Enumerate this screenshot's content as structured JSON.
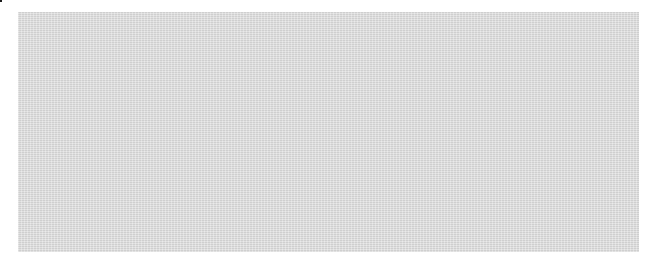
{
  "figure": {
    "kind": "kinship-diagram",
    "title": "",
    "panel": {
      "background_color": "#d6d6d6",
      "x": 18,
      "y": 12,
      "width": 621,
      "height": 240
    },
    "colors": {
      "line": "#262626",
      "fill_dark": "#595959",
      "fill_light": "#fbfbfb",
      "stroke": "#1a1a1a",
      "text": "#1f1f1f",
      "page_background": "#ffffff"
    },
    "legend_note": "",
    "symbols": {
      "circle_solid": "female solid dark",
      "circle_striped": "female white with diagonal dark band",
      "triangle_vsplit": "male dark-left white-right",
      "triangle_hsplit": "male white-top dark-bottom",
      "square_label": "ego reference square",
      "equals": "marriage link"
    }
  },
  "marriage": {
    "symbol": "=",
    "x": 307,
    "y": 86,
    "descent_line": {
      "x": 303,
      "y_from": 100,
      "y_to": 211
    }
  },
  "ego": {
    "label": "Ego",
    "x": 284,
    "y": 211,
    "width": 42,
    "height": 28
  },
  "generation_top": {
    "sibling_bars": [
      {
        "name": "left-sibling-bar",
        "x1": 106,
        "y": 33,
        "x2": 300,
        "drop_top_y": 33
      },
      {
        "name": "right-sibling-bar",
        "x1": 369,
        "y": 33,
        "x2": 563,
        "drop_top_y": 33
      }
    ],
    "nodes": [
      {
        "id": "t1",
        "type": "circle_solid",
        "cx": 106,
        "cy": 86,
        "r": 17,
        "has_descent": true
      },
      {
        "id": "t2",
        "type": "triangle_vsplit",
        "cx": 203,
        "cy": 86,
        "size": 42,
        "has_descent": true
      },
      {
        "id": "t3",
        "type": "triangle_vsplit",
        "cx": 282,
        "cy": 86,
        "size": 42,
        "has_descent": false
      },
      {
        "id": "t4",
        "type": "circle_solid",
        "cx": 369,
        "cy": 86,
        "r": 17,
        "has_descent": false
      },
      {
        "id": "t5",
        "type": "circle_solid",
        "cx": 466,
        "cy": 86,
        "r": 17,
        "has_descent": true
      },
      {
        "id": "t6",
        "type": "triangle_vsplit",
        "cx": 563,
        "cy": 86,
        "size": 42,
        "has_descent": true
      }
    ]
  },
  "generation_bottom": {
    "family_groups": [
      {
        "name": "family-1",
        "parent_drop_x": 106,
        "bar_y": 162,
        "bar_x1": 67,
        "bar_x2": 145,
        "children": [
          {
            "id": "b1",
            "type": "triangle_hsplit",
            "cx": 67,
            "cy": 218,
            "size": 44
          },
          {
            "id": "b2",
            "type": "circle_striped",
            "cx": 145,
            "cy": 218,
            "r": 18
          }
        ]
      },
      {
        "name": "family-2",
        "parent_drop_x": 203,
        "bar_y": 162,
        "bar_x1": 166,
        "bar_x2": 242,
        "children": [
          {
            "id": "b3",
            "type": "triangle_hsplit",
            "cx": 166,
            "cy": 218,
            "size": 44
          },
          {
            "id": "b4",
            "type": "circle_striped",
            "cx": 242,
            "cy": 218,
            "r": 18
          }
        ]
      },
      {
        "name": "family-3-ego",
        "parent_drop_x": 303,
        "bar_y": 162,
        "bar_x1": 263,
        "bar_x2": 350,
        "children": [
          {
            "id": "b5",
            "type": "triangle_hsplit",
            "cx": 263,
            "cy": 218,
            "size": 44
          },
          {
            "id": "b6",
            "type": "square_label",
            "cx": 305,
            "cy": 225
          },
          {
            "id": "b7",
            "type": "circle_striped",
            "cx": 350,
            "cy": 218,
            "r": 18
          }
        ]
      },
      {
        "name": "family-4",
        "parent_drop_x": 466,
        "bar_y": 162,
        "bar_x1": 427,
        "bar_x2": 505,
        "children": [
          {
            "id": "b8",
            "type": "triangle_hsplit",
            "cx": 427,
            "cy": 218,
            "size": 44
          },
          {
            "id": "b9",
            "type": "circle_striped",
            "cx": 505,
            "cy": 218,
            "r": 18
          }
        ]
      },
      {
        "name": "family-5",
        "parent_drop_x": 563,
        "bar_y": 162,
        "bar_x1": 526,
        "bar_x2": 602,
        "children": [
          {
            "id": "b10",
            "type": "triangle_hsplit",
            "cx": 526,
            "cy": 218,
            "size": 44
          },
          {
            "id": "b11",
            "type": "circle_striped",
            "cx": 602,
            "cy": 218,
            "r": 18
          }
        ]
      }
    ]
  }
}
